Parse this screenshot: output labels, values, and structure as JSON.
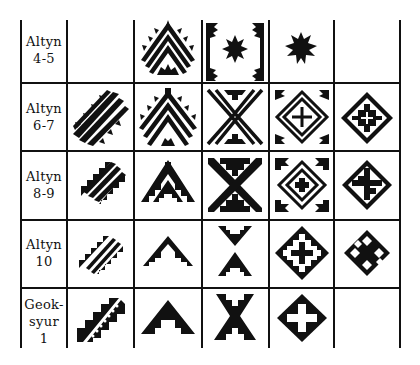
{
  "rows": [
    {
      "label_line1": "Altyn",
      "label_line2": "4-5",
      "label_line3": ""
    },
    {
      "label_line1": "Altyn",
      "label_line2": "6-7",
      "label_line3": ""
    },
    {
      "label_line1": "Altyn",
      "label_line2": "8-9",
      "label_line3": ""
    },
    {
      "label_line1": "Altyn",
      "label_line2": "10",
      "label_line3": ""
    },
    {
      "label_line1": "Geok-",
      "label_line2": "syur",
      "label_line3": "1"
    }
  ],
  "columns": [
    {
      "motif": "diagonal-stepped-band"
    },
    {
      "motif": "stepped-chevron"
    },
    {
      "motif": "stepped-x-cross"
    },
    {
      "motif": "stepped-diamond-with-cross"
    },
    {
      "motif": "small-stepped-diamond"
    }
  ],
  "cells": [
    [
      "",
      "hatched-chevron-with-sunburst",
      "framed-star-with-corner-teeth",
      "small-spiky-star",
      ""
    ],
    [
      "hatched-diagonal-band-serrated",
      "hatched-chevron-serrated",
      "hatched-x-with-stepped-triangles",
      "concentric-diamond-with-cross",
      "stepped-diamond-with-inner-cross"
    ],
    [
      "hatched-diagonal-band-stepped",
      "stepped-chevron-with-inner-steps",
      "stepped-x-cross",
      "serrated-diamond-with-cross",
      "diamond-with-stepped-cross"
    ],
    [
      "double-line-diagonal-stepped",
      "solid-stepped-chevron",
      "opposed-stepped-chevrons",
      "diamond-with-stepped-cross-frame",
      "diamond-with-cross"
    ],
    [
      "dotted-diagonal-stepped-band",
      "solid-stepped-chevron-large",
      "solid-x-cross",
      "diamond-with-white-cross",
      ""
    ]
  ],
  "colors": {
    "ink": "#111111",
    "paper": "#ffffff"
  }
}
